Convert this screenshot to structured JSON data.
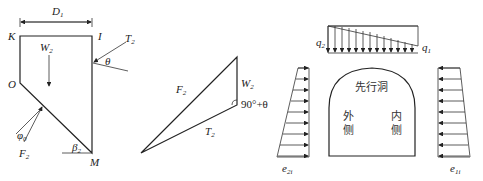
{
  "figure_a": {
    "dimension": "D",
    "dimension_sub": "1",
    "points": {
      "K": "K",
      "I": "I",
      "O": "O",
      "M": "M"
    },
    "weight": "W",
    "weight_sub": "2",
    "tension": "T",
    "tension_sub": "2",
    "theta": "θ",
    "force": "F",
    "force_sub": "2",
    "phi": "φ",
    "phi_sub": "0",
    "beta": "β",
    "beta_sub": "2"
  },
  "figure_b": {
    "F": "F",
    "F_sub": "2",
    "W": "W",
    "W_sub": "2",
    "T": "T",
    "T_sub": "2",
    "angle": "90°+θ"
  },
  "figure_c": {
    "q2": "q",
    "q2_sub": "2",
    "q1": "q",
    "q1_sub": "1",
    "e2": "e",
    "e2_sub": "2i",
    "e1": "e",
    "e1_sub": "1i",
    "tunnel_label": "先行洞",
    "outer_side_1": "外",
    "outer_side_2": "侧",
    "inner_side_1": "内",
    "inner_side_2": "侧"
  }
}
